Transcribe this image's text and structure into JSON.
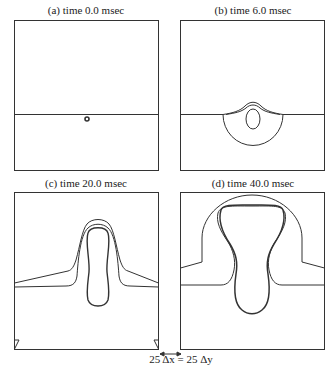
{
  "figure": {
    "panels": [
      {
        "id": "a",
        "title": "(a) time 0.0 msec"
      },
      {
        "id": "b",
        "title": "(b) time 6.0 msec"
      },
      {
        "id": "c",
        "title": "(c) time 20.0 msec"
      },
      {
        "id": "d",
        "title": "(d) time 40.0 msec"
      }
    ],
    "scale_caption": "25 Δx = 25 Δy",
    "line_color": "#333333"
  }
}
